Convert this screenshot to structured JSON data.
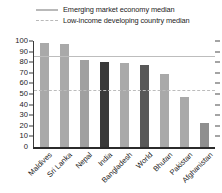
{
  "legend": {
    "items": [
      {
        "label": "Emerging market economy median",
        "style": "solid",
        "color": "#b9b9b9"
      },
      {
        "label": "Low-income developing country median",
        "style": "dashed",
        "color": "#b9b9b9"
      }
    ]
  },
  "axis": {
    "y_ticks": [
      "100",
      "90",
      "80",
      "70",
      "60",
      "50",
      "40",
      "30",
      "20",
      "10",
      "0"
    ]
  },
  "chart_data": {
    "type": "bar",
    "title": "",
    "xlabel": "",
    "ylabel": "",
    "ylim": [
      0,
      100
    ],
    "ytick_step": 10,
    "grid": false,
    "legend_position": "top",
    "categories": [
      "Maldives",
      "Sri Lanka",
      "Nepal",
      "India",
      "Bangladesh",
      "World",
      "Bhutan",
      "Pakistan",
      "Afghanistan"
    ],
    "values": [
      98,
      97,
      82,
      80,
      79,
      77,
      69,
      47,
      23
    ],
    "bar_colors": [
      "#a9a9a9",
      "#a9a9a9",
      "#a0a0a0",
      "#3a3a3a",
      "#a9a9a9",
      "#585858",
      "#a9a9a9",
      "#a9a9a9",
      "#8f8f8f"
    ],
    "annotations": [
      {
        "name": "Emerging market economy median",
        "value": 86,
        "style": "solid",
        "color": "#bdbdbd"
      },
      {
        "name": "Low-income developing country median",
        "value": 54,
        "style": "dashed",
        "color": "#bcbcbc"
      }
    ]
  }
}
